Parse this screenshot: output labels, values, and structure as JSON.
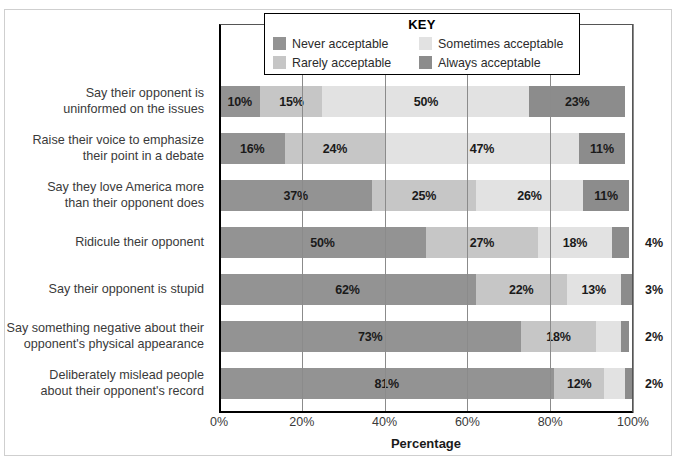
{
  "chart_data": {
    "type": "bar",
    "orientation": "horizontal",
    "stacked": true,
    "normalized_percent": true,
    "title": "",
    "xlabel": "Percentage",
    "ylabel": "",
    "xlim": [
      0,
      100
    ],
    "xticks": [
      "0%",
      "20%",
      "40%",
      "60%",
      "80%",
      "100%"
    ],
    "xtick_values": [
      0,
      20,
      40,
      60,
      80,
      100
    ],
    "grid": true,
    "legend_position": "top-center",
    "legend_title": "KEY",
    "categories": [
      "Say their opponent is uninformed on the issues",
      "Raise their voice to emphasize their point in a debate",
      "Say they love America more than their opponent does",
      "Ridicule their opponent",
      "Say their opponent is stupid",
      "Say something negative about their opponent's physical appearance",
      "Deliberately mislead people about their opponent's record"
    ],
    "category_lines": [
      [
        "Say their opponent is",
        "uninformed on the issues"
      ],
      [
        "Raise their voice to emphasize",
        "their point in a debate"
      ],
      [
        "Say they love America more",
        "than their opponent does"
      ],
      [
        "Ridicule their opponent"
      ],
      [
        "Say their opponent is stupid"
      ],
      [
        "Say something negative about their",
        "opponent's physical appearance"
      ],
      [
        "Deliberately mislead people",
        "about their opponent's record"
      ]
    ],
    "series": [
      {
        "name": "Never acceptable",
        "color": "#939393",
        "values": [
          10,
          16,
          37,
          50,
          62,
          73,
          81
        ]
      },
      {
        "name": "Rarely acceptable",
        "color": "#c6c6c6",
        "values": [
          15,
          24,
          25,
          27,
          22,
          18,
          12
        ]
      },
      {
        "name": "Sometimes acceptable",
        "color": "#e2e2e2",
        "values": [
          50,
          47,
          26,
          18,
          13,
          6,
          5
        ]
      },
      {
        "name": "Always acceptable",
        "color": "#8c8c8c",
        "values": [
          23,
          11,
          11,
          4,
          3,
          2,
          2
        ]
      }
    ],
    "data_labels": [
      [
        "10%",
        "15%",
        "50%",
        "23%"
      ],
      [
        "16%",
        "24%",
        "47%",
        "11%"
      ],
      [
        "37%",
        "25%",
        "26%",
        "11%"
      ],
      [
        "50%",
        "27%",
        "18%",
        "4%"
      ],
      [
        "62%",
        "22%",
        "13%",
        "3%"
      ],
      [
        "73%",
        "18%",
        "6%",
        "2%"
      ],
      [
        "81%",
        "12%",
        "5%",
        "2%"
      ]
    ],
    "outside_labels": [
      {
        "row": 3,
        "text": "4%"
      },
      {
        "row": 4,
        "text": "3%"
      },
      {
        "row": 5,
        "text": "2%"
      },
      {
        "row": 6,
        "text": "2%"
      }
    ]
  },
  "legend": {
    "title": "KEY",
    "items": [
      {
        "label": "Never acceptable",
        "color": "#939393",
        "icon": "color-swatch-icon"
      },
      {
        "label": "Sometimes acceptable",
        "color": "#e2e2e2",
        "icon": "color-swatch-icon"
      },
      {
        "label": "Rarely acceptable",
        "color": "#c6c6c6",
        "icon": "color-swatch-icon"
      },
      {
        "label": "Always acceptable",
        "color": "#8c8c8c",
        "icon": "color-swatch-icon"
      }
    ]
  },
  "axis": {
    "x_title": "Percentage",
    "ticks": [
      "0%",
      "20%",
      "40%",
      "60%",
      "80%",
      "100%"
    ]
  }
}
